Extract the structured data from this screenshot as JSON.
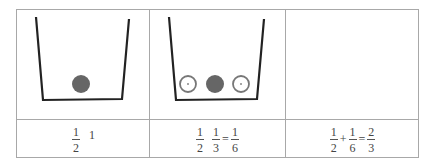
{
  "diagram": {
    "colors": {
      "border": "#a8a8a8",
      "container": "#222222",
      "filled_ball": "#666666",
      "open_ball": "#777777",
      "text": "#444444"
    },
    "cells": [
      {
        "id": "cell-1",
        "container": true,
        "balls": [
          {
            "type": "filled"
          }
        ],
        "caption": {
          "frac1": {
            "num": "1",
            "den": "2"
          },
          "trailing": "1"
        }
      },
      {
        "id": "cell-2",
        "container": true,
        "balls": [
          {
            "type": "open"
          },
          {
            "type": "filled"
          },
          {
            "type": "open"
          }
        ],
        "caption": {
          "frac1": {
            "num": "1",
            "den": "2"
          },
          "frac2": {
            "num": "1",
            "den": "3"
          },
          "op": "=",
          "frac3": {
            "num": "1",
            "den": "6"
          }
        }
      },
      {
        "id": "cell-3",
        "container": false,
        "balls": [],
        "caption": {
          "frac1": {
            "num": "1",
            "den": "2"
          },
          "op1": "+",
          "frac2": {
            "num": "1",
            "den": "6"
          },
          "op2": "=",
          "frac3": {
            "num": "2",
            "den": "3"
          }
        }
      }
    ]
  }
}
